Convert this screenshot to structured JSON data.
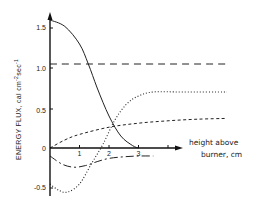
{
  "chart_data": {
    "type": "line",
    "title": "",
    "xlabel": "height above burner, cm",
    "xlabel_lines": [
      "height above",
      "burner, cm"
    ],
    "ylabel": "ENERGY FLUX, cal cm^-2 sec^-1",
    "ylabel_parts": {
      "main": "ENERGY FLUX,  cal  cm",
      "sup1": "-2",
      "mid": "sec",
      "sup2": "-1"
    },
    "x_ticks": [
      "1",
      "2",
      "3"
    ],
    "y_ticks": [
      "1.5",
      "1.0",
      "0.5",
      "0",
      "-0.5"
    ],
    "xlim": [
      0,
      6
    ],
    "ylim": [
      -0.6,
      1.7
    ],
    "grid": false,
    "legend": "none",
    "series": [
      {
        "name": "solid",
        "style": "solid",
        "x": [
          0,
          0.5,
          1.0,
          1.3,
          1.6,
          2.0,
          2.4,
          2.8,
          3.0
        ],
        "y": [
          1.6,
          1.52,
          1.3,
          1.05,
          0.75,
          0.4,
          0.15,
          0.03,
          0.0
        ]
      },
      {
        "name": "long-dash",
        "style": "long-dash",
        "x": [
          0,
          6
        ],
        "y": [
          1.05,
          1.05
        ]
      },
      {
        "name": "dotted",
        "style": "dotted",
        "x": [
          0,
          0.3,
          0.6,
          1.0,
          1.4,
          1.8,
          2.2,
          2.6,
          3.0,
          3.5,
          4.5,
          6.0
        ],
        "y": [
          -0.45,
          -0.53,
          -0.55,
          -0.45,
          -0.2,
          0.05,
          0.35,
          0.55,
          0.65,
          0.7,
          0.7,
          0.7
        ]
      },
      {
        "name": "short-dash",
        "style": "short-dash",
        "x": [
          0,
          0.5,
          1.0,
          2.0,
          3.0,
          4.0,
          5.0,
          6.0
        ],
        "y": [
          0.0,
          0.1,
          0.17,
          0.26,
          0.31,
          0.34,
          0.36,
          0.37
        ]
      },
      {
        "name": "dash-dot",
        "style": "dash-dot",
        "x": [
          0,
          0.4,
          0.8,
          1.2,
          1.6,
          2.0,
          2.5,
          3.0,
          3.5
        ],
        "y": [
          -0.1,
          -0.2,
          -0.24,
          -0.22,
          -0.17,
          -0.13,
          -0.11,
          -0.1,
          -0.1
        ]
      }
    ]
  }
}
